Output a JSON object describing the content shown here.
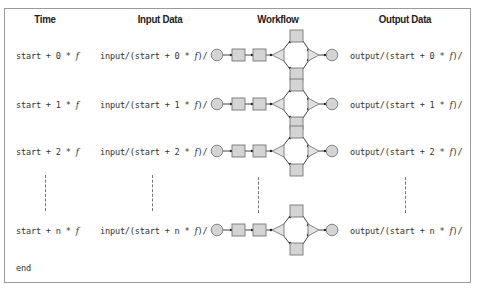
{
  "headers": {
    "time": "Time",
    "input": "Input Data",
    "workflow": "Workflow",
    "output": "Output Data"
  },
  "rows": [
    {
      "time_prefix": "start + 0 * ",
      "time_var": "f",
      "input_prefix": "input/(start + 0 * ",
      "input_var": "f",
      "input_suffix": ")/",
      "output_prefix": "output/(start + 0 * ",
      "output_var": "f",
      "output_suffix": ")/"
    },
    {
      "time_prefix": "start + 1 * ",
      "time_var": "f",
      "input_prefix": "input/(start + 1 * ",
      "input_var": "f",
      "input_suffix": ")/",
      "output_prefix": "output/(start + 1 * ",
      "output_var": "f",
      "output_suffix": ")/"
    },
    {
      "time_prefix": "start + 2 * ",
      "time_var": "f",
      "input_prefix": "input/(start + 2 * ",
      "input_var": "f",
      "input_suffix": ")/",
      "output_prefix": "output/(start + 2 * ",
      "output_var": "f",
      "output_suffix": ")/"
    },
    {
      "time_prefix": "start + n * ",
      "time_var": "f",
      "input_prefix": "input/(start + n * ",
      "input_var": "f",
      "input_suffix": ")/",
      "output_prefix": "output/(start + n * ",
      "output_var": "f",
      "output_suffix": ")/"
    }
  ],
  "footer": {
    "end_label": "end"
  },
  "colors": {
    "node_fill": "#d4d4d4",
    "node_stroke": "#777777",
    "edge": "#444444",
    "border": "#9a9a9a"
  },
  "workflow_nodes": [
    "start-circle",
    "task-square-1",
    "task-square-2",
    "split-gateway-triangle",
    "parallel-task-top",
    "parallel-task-bottom",
    "join-gateway-triangle",
    "end-circle"
  ]
}
